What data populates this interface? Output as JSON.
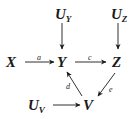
{
  "diagram": {
    "type": "causal-graph",
    "nodes": {
      "X": {
        "label": "X"
      },
      "Y": {
        "label": "Y"
      },
      "Z": {
        "label": "Z"
      },
      "V": {
        "label": "V"
      },
      "UY": {
        "label": "U",
        "sub": "Y"
      },
      "UZ": {
        "label": "U",
        "sub": "Z"
      },
      "UV": {
        "label": "U",
        "sub": "V"
      }
    },
    "edges": [
      {
        "from": "X",
        "to": "Y",
        "label": "a"
      },
      {
        "from": "Y",
        "to": "Z",
        "label": "c"
      },
      {
        "from": "V",
        "to": "Y",
        "label": "d"
      },
      {
        "from": "Z",
        "to": "V",
        "label": "e"
      },
      {
        "from": "UY",
        "to": "Y",
        "label": ""
      },
      {
        "from": "UZ",
        "to": "Z",
        "label": ""
      },
      {
        "from": "UV",
        "to": "V",
        "label": ""
      }
    ]
  },
  "colors": {
    "ink": "#1a1a1a",
    "background": "#ffffff"
  }
}
